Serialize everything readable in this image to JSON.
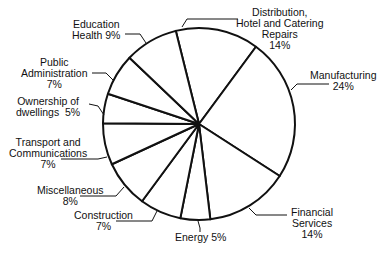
{
  "chart_data": {
    "type": "pie",
    "title": "",
    "start_angle_deg": -104,
    "direction": "clockwise",
    "categories": [
      "Distribution, Hotel and Catering Repairs",
      "Manufacturing",
      "Financial Services",
      "Energy",
      "Construction",
      "Miscellaneous",
      "Transport and Communications",
      "Ownership of dwellings",
      "Public Administration",
      "Education Health"
    ],
    "values": [
      14,
      24,
      14,
      5,
      7,
      8,
      7,
      5,
      7,
      9
    ],
    "unit": "%",
    "legend": "none (leader-line labels)",
    "style": {
      "fill": "#ffffff",
      "stroke": "#111111"
    }
  },
  "labels": {
    "distribution": {
      "lines": [
        "Distribution,",
        "Hotel and Catering",
        "Repairs",
        "14%"
      ]
    },
    "manufacturing": {
      "lines": [
        "Manufacturing",
        "24%"
      ]
    },
    "financial": {
      "lines": [
        "Financial",
        "Services",
        "14%"
      ]
    },
    "energy": {
      "lines": [
        "Energy 5%"
      ]
    },
    "construction": {
      "lines": [
        "Construction",
        "7%"
      ]
    },
    "miscellaneous": {
      "lines": [
        "Miscellaneous",
        "8%"
      ]
    },
    "transport": {
      "lines": [
        "Transport and",
        "Communications",
        "7%"
      ]
    },
    "ownership": {
      "lines": [
        "Ownership of",
        "dwellings  5%"
      ]
    },
    "public": {
      "lines": [
        "Public",
        "Administration",
        "7%"
      ]
    },
    "education": {
      "lines": [
        "Education",
        "Health 9%"
      ]
    }
  }
}
